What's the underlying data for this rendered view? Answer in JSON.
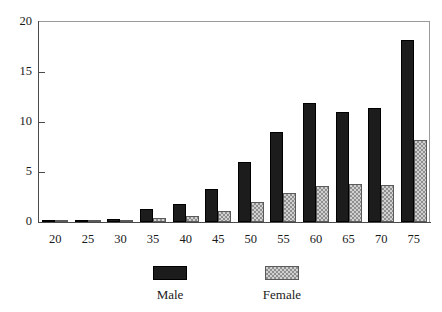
{
  "chart_data": {
    "type": "bar",
    "title": "",
    "subtitle": "",
    "xlabel": "",
    "ylabel": "",
    "categories": [
      "20",
      "25",
      "30",
      "35",
      "40",
      "45",
      "50",
      "55",
      "60",
      "65",
      "70",
      "75"
    ],
    "series": [
      {
        "name": "Male",
        "color": "#1c1c1c",
        "values": [
          0.15,
          0.2,
          0.35,
          1.3,
          1.8,
          3.3,
          6.0,
          9.0,
          11.9,
          11.0,
          11.4,
          18.2
        ]
      },
      {
        "name": "Female",
        "color": "#d0d0d0",
        "values": [
          0.1,
          0.1,
          0.15,
          0.4,
          0.6,
          1.1,
          2.0,
          2.9,
          3.6,
          3.8,
          3.7,
          8.2
        ]
      }
    ],
    "ylim": [
      0,
      20
    ],
    "yticks": [
      0,
      5,
      10,
      15,
      20
    ],
    "yticklabels": [
      "0",
      "5",
      "10",
      "15",
      "20"
    ],
    "grid": false,
    "legend_position": "bottom",
    "legend_entries": [
      "Male",
      "Female"
    ]
  },
  "legend": {
    "male_label": "Male",
    "female_label": "Female"
  }
}
